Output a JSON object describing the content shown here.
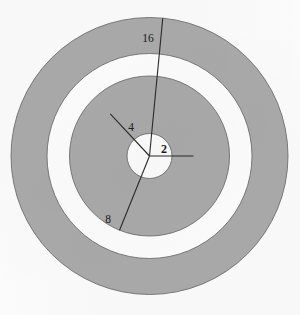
{
  "figure": {
    "background_color": "#fbfbfb",
    "ring_fill_gray": "#aaaaaa",
    "ring_fill_white": "#fdfdfd",
    "ring_stroke": "#6e6e6e",
    "line_color": "#2b2b2b",
    "center": {
      "x": 149.5,
      "y": 156
    }
  },
  "labels": {
    "outer": "16",
    "lower_left": "8",
    "upper_left": "4",
    "center": "2"
  },
  "chart_data": {
    "type": "pie",
    "subtitle": "",
    "xlabel": "",
    "ylabel": "",
    "legend_position": "none",
    "grid": false,
    "center_x": 149.5,
    "center_y": 156,
    "radii": [
      138.5,
      102.5,
      80.0,
      57.5,
      22.5
    ],
    "radius_labels": [
      "16",
      "",
      "8",
      "4",
      "2"
    ],
    "categories": [
      "16",
      "8",
      "4",
      "2"
    ],
    "values": [
      16,
      8,
      4,
      2
    ],
    "rings": [
      {
        "name": "outer-gray-annulus",
        "outer_radius": 138.5,
        "inner_radius": 102.5,
        "fill": "#aaaaaa"
      },
      {
        "name": "outer-white-annulus",
        "outer_radius": 102.5,
        "inner_radius": 80.0,
        "fill": "#fdfdfd"
      },
      {
        "name": "middle-gray-annulus",
        "outer_radius": 80.0,
        "inner_radius": 57.5,
        "fill": "#aaaaaa"
      },
      {
        "name": "inner-white-disc",
        "outer_radius": 22.5,
        "inner_radius": 0,
        "fill": "#fdfdfd"
      }
    ],
    "radial_lines": [
      {
        "name": "radius-16",
        "label": "16",
        "angle_deg": 84.5,
        "length": 138.5,
        "label_x": 148,
        "label_y": 39
      },
      {
        "name": "radius-8",
        "label": "8",
        "angle_deg": 248.0,
        "length": 80.0,
        "label_x": 108,
        "label_y": 220
      },
      {
        "name": "radius-4",
        "label": "4",
        "angle_deg": 133.0,
        "length": 57.5,
        "label_x": 131,
        "label_y": 128
      },
      {
        "name": "radius-2",
        "label": "2",
        "angle_deg": 0.0,
        "length": 44.0,
        "label_x": 163,
        "label_y": 151
      }
    ]
  }
}
